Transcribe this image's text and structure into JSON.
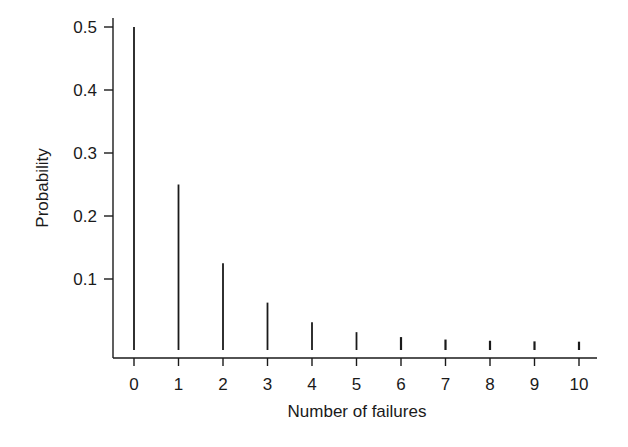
{
  "chart_data": {
    "type": "bar",
    "subtype": "stem",
    "title": "",
    "xlabel": "Number of failures",
    "ylabel": "Probability",
    "categories": [
      "0",
      "1",
      "2",
      "3",
      "4",
      "5",
      "6",
      "7",
      "8",
      "9",
      "10"
    ],
    "values": [
      0.5,
      0.25,
      0.125,
      0.0625,
      0.03125,
      0.015625,
      0.0078,
      0.0039,
      0.002,
      0.001,
      0.0005
    ],
    "yticks": [
      "0.1",
      "0.2",
      "0.3",
      "0.4",
      "0.5"
    ],
    "ytick_values": [
      0.1,
      0.2,
      0.3,
      0.4,
      0.5
    ],
    "ylim": [
      0,
      0.5
    ],
    "xlim": [
      0,
      10
    ],
    "grid": false,
    "legend": null,
    "colors": {
      "bars": "#1a1a1a",
      "axes": "#1a1a1a",
      "background": "#ffffff"
    }
  }
}
